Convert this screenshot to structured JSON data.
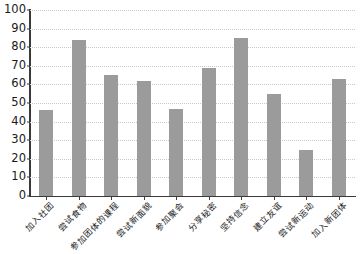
{
  "chart_data": {
    "type": "bar",
    "title": "",
    "subtitle": "",
    "xlabel": "",
    "ylabel": "",
    "categories": [
      "加入社团",
      "尝试食物",
      "参加团体的课程",
      "尝试新面貌",
      "参加聚会",
      "分享秘密",
      "坚持信念",
      "建立友谊",
      "尝试新运动",
      "加入新团体"
    ],
    "values": [
      46,
      84,
      65,
      62,
      47,
      69,
      85,
      55,
      25,
      63
    ],
    "ylim": [
      0,
      100
    ],
    "yticks": [
      0,
      10,
      20,
      30,
      40,
      50,
      60,
      70,
      80,
      90,
      100
    ],
    "ytick_labels": [
      "0",
      "10",
      "20",
      "30",
      "40",
      "50",
      "60",
      "70",
      "80",
      "90",
      "100"
    ],
    "grid": true,
    "grid_axis": "y",
    "legend": false,
    "legend_position": "none",
    "bar_color": "#9b9b9b",
    "axis_color": "#3a3a3a",
    "grid_color": "#c9c9c9",
    "background_color": "#ffffff",
    "xtick_rotation": -45
  }
}
